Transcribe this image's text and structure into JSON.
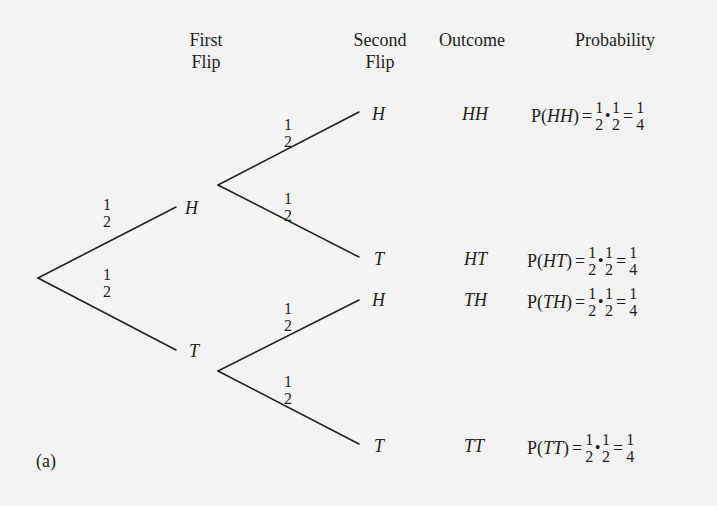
{
  "headers": {
    "first_flip": [
      "First",
      "Flip"
    ],
    "second_flip": [
      "Second",
      "Flip"
    ],
    "outcome": "Outcome",
    "probability": "Probability"
  },
  "tree": {
    "root": {
      "x": 38,
      "y": 278
    },
    "first_level": [
      {
        "label": "H",
        "branch_prob": {
          "num": "1",
          "den": "2"
        }
      },
      {
        "label": "T",
        "branch_prob": {
          "num": "1",
          "den": "2"
        }
      }
    ],
    "second_level": [
      {
        "parent": "H",
        "label": "H",
        "branch_prob": {
          "num": "1",
          "den": "2"
        }
      },
      {
        "parent": "H",
        "label": "T",
        "branch_prob": {
          "num": "1",
          "den": "2"
        }
      },
      {
        "parent": "T",
        "label": "H",
        "branch_prob": {
          "num": "1",
          "den": "2"
        }
      },
      {
        "parent": "T",
        "label": "T",
        "branch_prob": {
          "num": "1",
          "den": "2"
        }
      }
    ],
    "line_color": "#222222"
  },
  "rows": [
    {
      "outcome": "HH",
      "p_label": "P(",
      "p_event": "HH",
      "p_close": ")",
      "eq": "=",
      "f1": {
        "num": "1",
        "den": "2"
      },
      "dot": "•",
      "f2": {
        "num": "1",
        "den": "2"
      },
      "eq2": "=",
      "result": {
        "num": "1",
        "den": "4"
      }
    },
    {
      "outcome": "HT",
      "p_label": "P(",
      "p_event": "HT",
      "p_close": ")",
      "eq": "=",
      "f1": {
        "num": "1",
        "den": "2"
      },
      "dot": "•",
      "f2": {
        "num": "1",
        "den": "2"
      },
      "eq2": "=",
      "result": {
        "num": "1",
        "den": "4"
      }
    },
    {
      "outcome": "TH",
      "p_label": "P(",
      "p_event": "TH",
      "p_close": ")",
      "eq": "=",
      "f1": {
        "num": "1",
        "den": "2"
      },
      "dot": "•",
      "f2": {
        "num": "1",
        "den": "2"
      },
      "eq2": "=",
      "result": {
        "num": "1",
        "den": "4"
      }
    },
    {
      "outcome": "TT",
      "p_label": "P(",
      "p_event": "TT",
      "p_close": ")",
      "eq": "=",
      "f1": {
        "num": "1",
        "den": "2"
      },
      "dot": "•",
      "f2": {
        "num": "1",
        "den": "2"
      },
      "eq2": "=",
      "result": {
        "num": "1",
        "den": "4"
      }
    }
  ],
  "caption": "(a)"
}
